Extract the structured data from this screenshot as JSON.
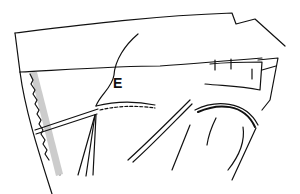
{
  "illustration": {
    "subject": "sewing diagram: sleeve being set into garment with pins",
    "labels": [
      {
        "id": "E",
        "text": "E"
      }
    ],
    "colors": {
      "line": "#111111",
      "background": "#ffffff",
      "seam_allowance_fill": "#cccccc"
    }
  }
}
